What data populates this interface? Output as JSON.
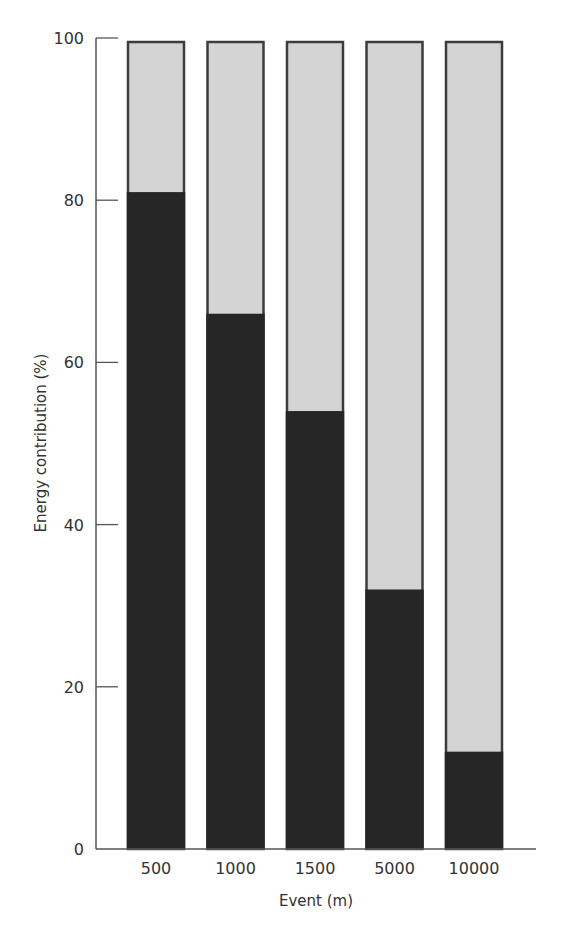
{
  "chart_data": {
    "type": "bar",
    "stacked": true,
    "title": "",
    "xlabel": "Event (m)",
    "ylabel": "Energy contribution (%)",
    "categories": [
      "500",
      "1000",
      "1500",
      "5000",
      "10000"
    ],
    "series": [
      {
        "name": "dark (lower) component",
        "color": "#262626",
        "values": [
          81,
          66,
          54,
          32,
          12
        ]
      },
      {
        "name": "light (upper) component",
        "color": "#d4d4d4",
        "values": [
          19,
          34,
          46,
          68,
          88
        ]
      }
    ],
    "ylim": [
      0,
      100
    ],
    "yticks": [
      0,
      20,
      40,
      60,
      80,
      100
    ],
    "grid": false,
    "legend": "none"
  },
  "axes": {
    "x_title": "Event (m)",
    "y_title": "Energy contribution (%)",
    "y_tick_labels": [
      "0",
      "20",
      "40",
      "60",
      "80",
      "100"
    ],
    "x_tick_labels": [
      "500",
      "1000",
      "1500",
      "5000",
      "10000"
    ]
  }
}
